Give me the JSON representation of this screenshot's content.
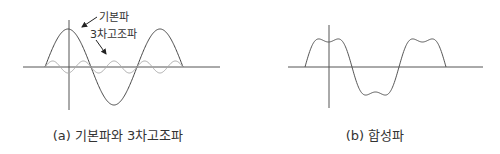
{
  "panels": [
    {
      "id": "a",
      "caption": "(a) 기본파와 3차고조파",
      "labels": {
        "fundamental": "기본파",
        "third_harmonic": "3차고조파"
      }
    },
    {
      "id": "b",
      "caption": "(b) 합성파"
    }
  ],
  "colors": {
    "axis": "#555555",
    "fundamental": "#444444",
    "harmonic": "#aaaaaa",
    "composite": "#555555",
    "text": "#333333"
  },
  "chart_data": [
    {
      "type": "line",
      "title": "(a) 기본파와 3차고조파",
      "series": [
        {
          "name": "기본파",
          "function": "sin(x)",
          "x_range_deg": [
            -180,
            540
          ],
          "amplitude": 1.0
        },
        {
          "name": "3차고조파",
          "function": "sin(3x)",
          "x_range_deg": [
            -180,
            540
          ],
          "amplitude": 0.15
        }
      ],
      "xlabel": "",
      "ylabel": "",
      "grid": false
    },
    {
      "type": "line",
      "title": "(b) 합성파",
      "series": [
        {
          "name": "합성파",
          "function": "sin(x) + 0.15*sin(3x)",
          "x_range_deg": [
            -180,
            540
          ]
        }
      ],
      "xlabel": "",
      "ylabel": "",
      "grid": false
    }
  ]
}
